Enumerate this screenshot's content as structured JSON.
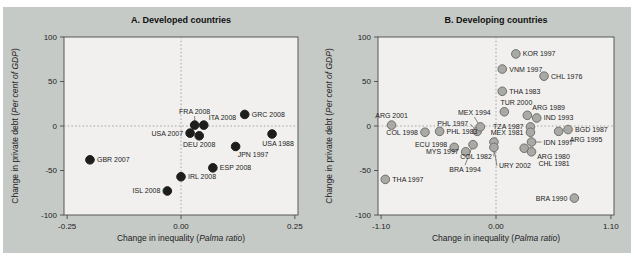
{
  "page": {
    "background": "#ffffff",
    "band_color": "#c6cac7",
    "plot_bg": "#f1f0ee",
    "plot_border": "#4a4a48",
    "dotted_line_color": "#8f8f8d",
    "text_color": "#222222",
    "leader_color": "#555553"
  },
  "chart_data": [
    {
      "type": "scatter",
      "title": "A. Developed countries",
      "xlabel": {
        "pre": "Change in inequality (",
        "italic": "Palma ratio",
        "post": ")"
      },
      "ylabel": {
        "pre": "Change in private debt (",
        "italic": "Per cent of GDP",
        "post": ")"
      },
      "xlim": [
        -0.257,
        0.257
      ],
      "ylim": [
        -100,
        100
      ],
      "x_ticks": [
        {
          "v": -0.25,
          "t": "-0.25"
        },
        {
          "v": 0,
          "t": "0.00"
        },
        {
          "v": 0.25,
          "t": "0.25"
        }
      ],
      "y_ticks": [
        {
          "v": 100,
          "t": "100"
        },
        {
          "v": 50,
          "t": "50"
        },
        {
          "v": 0,
          "t": "0"
        },
        {
          "v": -50,
          "t": "-50"
        },
        {
          "v": -100,
          "t": "-100"
        }
      ],
      "zero_lines": true,
      "legend": "none",
      "grid": false,
      "dot": {
        "fill": "#1d1d1b",
        "stroke": "#1d1d1b",
        "r": 4.3
      },
      "points": [
        {
          "label": "GBR 2007",
          "x": -0.2,
          "y": -38,
          "lp": "r",
          "leader": true
        },
        {
          "label": "ISL 2008",
          "x": -0.03,
          "y": -73,
          "lp": "l"
        },
        {
          "label": "IRL 2008",
          "x": 0.0,
          "y": -57,
          "lp": "r"
        },
        {
          "label": "USA 2007",
          "x": 0.02,
          "y": -8,
          "lp": "l"
        },
        {
          "label": "FRA 2008",
          "x": 0.03,
          "y": 1,
          "lp": "a",
          "ldy": -4,
          "leader": true
        },
        {
          "label": "ITA 2008",
          "x": 0.05,
          "y": 1,
          "lp": "ar"
        },
        {
          "label": "DEU 2008",
          "x": 0.04,
          "y": -11,
          "lp": "b"
        },
        {
          "label": "GRC 2008",
          "x": 0.14,
          "y": 13,
          "lp": "r"
        },
        {
          "label": "USA 1988",
          "x": 0.2,
          "y": -9,
          "lp": "b",
          "ldx": 6
        },
        {
          "label": "JPN 1997",
          "x": 0.12,
          "y": -23,
          "lp": "br",
          "ldx": -3
        },
        {
          "label": "ESP 2008",
          "x": 0.07,
          "y": -47,
          "lp": "r"
        }
      ]
    },
    {
      "type": "scatter",
      "title": "B. Developing countries",
      "xlabel": {
        "pre": "Change in inequality (",
        "italic": "Palma ratio",
        "post": ")"
      },
      "ylabel": {
        "pre": "Change in private debt (",
        "italic": "Per cent of GDP",
        "post": ")"
      },
      "xlim": [
        -1.13,
        1.13
      ],
      "ylim": [
        -100,
        100
      ],
      "x_ticks": [
        {
          "v": -1.1,
          "t": "-1.10"
        },
        {
          "v": 0,
          "t": "0.00"
        },
        {
          "v": 1.1,
          "t": "1.10"
        }
      ],
      "y_ticks": [
        {
          "v": 100,
          "t": "100"
        },
        {
          "v": 50,
          "t": "50"
        },
        {
          "v": 0,
          "t": "0"
        },
        {
          "v": -50,
          "t": "-50"
        },
        {
          "v": -100,
          "t": "-100"
        }
      ],
      "zero_lines": true,
      "legend": "none",
      "grid": false,
      "dot": {
        "fill": "#a9a9a5",
        "stroke": "#6f6f6b",
        "r": 4.3
      },
      "points": [
        {
          "label": "KOR 1997",
          "x": 0.19,
          "y": 81,
          "lp": "r"
        },
        {
          "label": "VNM 1997",
          "x": 0.06,
          "y": 64,
          "lp": "r"
        },
        {
          "label": "CHL 1976",
          "x": 0.46,
          "y": 56,
          "lp": "r"
        },
        {
          "label": "THA 1983",
          "x": 0.06,
          "y": 39,
          "lp": "r"
        },
        {
          "label": "TUR 2000",
          "x": 0.08,
          "y": 16,
          "lp": "a",
          "ldx": 12
        },
        {
          "label": "ARG 1989",
          "x": 0.3,
          "y": 12,
          "lp": "ar"
        },
        {
          "label": "IND 1993",
          "x": 0.39,
          "y": 9,
          "lp": "r"
        },
        {
          "label": "ARG 2001",
          "x": -1.0,
          "y": 1,
          "lp": "a"
        },
        {
          "label": "COL 1998",
          "x": -0.68,
          "y": -7,
          "lp": "l"
        },
        {
          "label": "PHL 1983",
          "x": -0.54,
          "y": -6,
          "lp": "r"
        },
        {
          "label": "PHL 1997",
          "x": -0.18,
          "y": -6,
          "lp": "al",
          "ldx": -4,
          "leader": true
        },
        {
          "label": "MEX 1994",
          "x": -0.15,
          "y": -1,
          "lp": "a",
          "ldx": -6,
          "ldy": -5,
          "leader": true
        },
        {
          "label": "TZA 1987",
          "x": 0.33,
          "y": -1,
          "lp": "l"
        },
        {
          "label": "MEX 1981",
          "x": 0.33,
          "y": -7,
          "lp": "l"
        },
        {
          "label": "BGD 1987",
          "x": 0.69,
          "y": -4,
          "lp": "r"
        },
        {
          "label": "ARG 1995",
          "x": 0.6,
          "y": -6,
          "lp": "br",
          "ldx": 6
        },
        {
          "label": "IDN 1997",
          "x": 0.34,
          "y": -18,
          "lp": "r",
          "ldx": 5,
          "leader": true
        },
        {
          "label": "ARG 1980",
          "x": 0.27,
          "y": -25,
          "lp": "br",
          "ldx": 8
        },
        {
          "label": "CHL 1981",
          "x": 0.34,
          "y": -29,
          "lp": "br",
          "ldx": 2,
          "ldy": 3
        },
        {
          "label": "COL 1982",
          "x": -0.02,
          "y": -18,
          "lp": "bl",
          "ldx": 3,
          "ldy": 6,
          "leader": true
        },
        {
          "label": "URY 2002",
          "x": -0.02,
          "y": -24,
          "lp": "br",
          "ldy": 10,
          "leader": true
        },
        {
          "label": "ECU 1998",
          "x": -0.4,
          "y": -24,
          "lp": "l",
          "ldy": -3
        },
        {
          "label": "MYS 1997",
          "x": -0.29,
          "y": -29,
          "lp": "l"
        },
        {
          "label": "BRA 1994",
          "x": -0.22,
          "y": -21,
          "lp": "b",
          "ldx": -8,
          "ldy": 16,
          "leader": true
        },
        {
          "label": "THA 1997",
          "x": -1.06,
          "y": -60,
          "lp": "r"
        },
        {
          "label": "BRA 1990",
          "x": 0.75,
          "y": -81,
          "lp": "l"
        }
      ]
    }
  ]
}
